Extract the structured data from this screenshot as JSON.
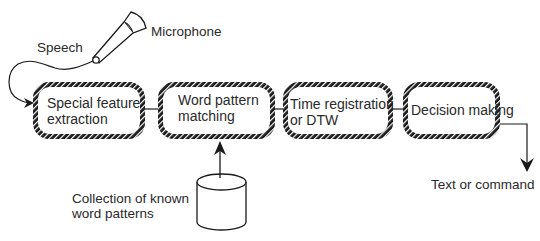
{
  "diagram": {
    "input_labels": {
      "speech": "Speech",
      "microphone": "Microphone"
    },
    "stages": [
      {
        "line1": "Special feature",
        "line2": "extraction"
      },
      {
        "line1": "Word pattern",
        "line2": "matching"
      },
      {
        "line1": "Time registration",
        "line2": "or DTW"
      },
      {
        "line1": "Decision making",
        "line2": ""
      }
    ],
    "database": {
      "line1": "Collection of known",
      "line2": "word patterns"
    },
    "output": "Text or command",
    "colors": {
      "stroke": "#1a1a1a",
      "background": "#ffffff",
      "text": "#2a2a2a"
    }
  }
}
